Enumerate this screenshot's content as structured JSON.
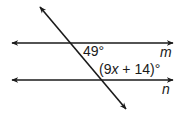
{
  "diagram": {
    "type": "parallel-lines-transversal",
    "lines": [
      {
        "name": "m",
        "label": "m",
        "y": 43
      },
      {
        "name": "n",
        "label": "n",
        "y": 80
      }
    ],
    "angles": [
      {
        "label": "49°",
        "position": "below line m, right of transversal"
      },
      {
        "label_parts": [
          "(9",
          "x",
          " + 14)°"
        ],
        "label": "(9x + 14)°",
        "position": "above line n, right of transversal"
      }
    ],
    "colors": {
      "stroke": "#1a1a1a",
      "background": "#ffffff"
    }
  }
}
